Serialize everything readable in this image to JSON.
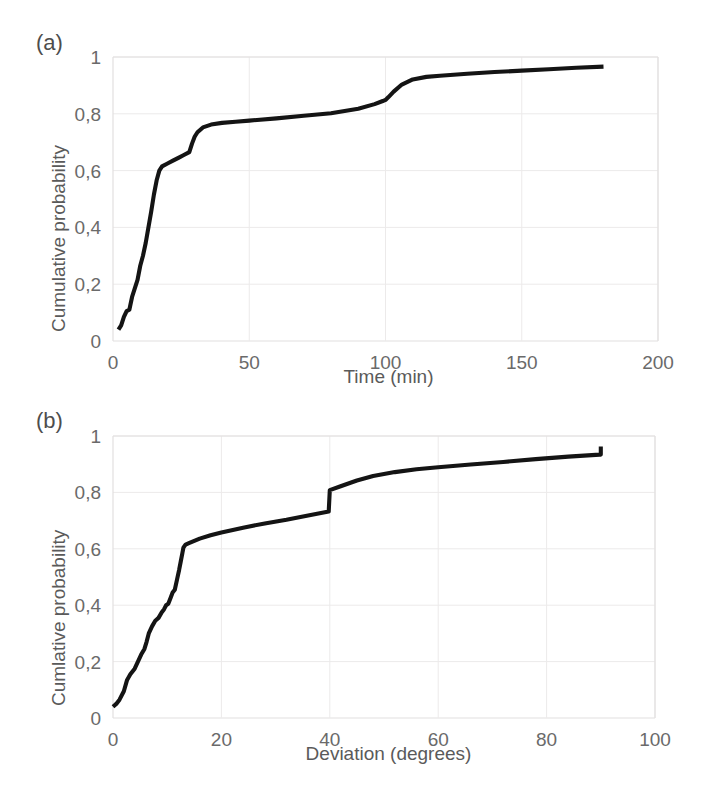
{
  "figure": {
    "background": "#ffffff",
    "curve_color": "#141414",
    "grid_color": "#eceaea",
    "text_color": "#5a5a5a"
  },
  "panels": [
    {
      "tag": "(a)",
      "ylabel": "Cumulative probability",
      "xlabel": "Time (min)",
      "xticks": [
        "0",
        "50",
        "100",
        "150",
        "200"
      ],
      "yticks": [
        "0",
        "0,2",
        "0,4",
        "0,6",
        "0,8",
        "1"
      ]
    },
    {
      "tag": "(b)",
      "ylabel": "Cumlative probability",
      "xlabel": "Deviation (degrees)",
      "xticks": [
        "0",
        "20",
        "40",
        "60",
        "80",
        "100"
      ],
      "yticks": [
        "0",
        "0,2",
        "0,4",
        "0,6",
        "0,8",
        "1"
      ]
    }
  ],
  "chart_data": [
    {
      "type": "line",
      "title": "(a)",
      "xlabel": "Time (min)",
      "ylabel": "Cumulative probability",
      "xlim": [
        0,
        200
      ],
      "ylim": [
        0,
        1
      ],
      "xticks": [
        0,
        50,
        100,
        150,
        200
      ],
      "yticks": [
        0,
        0.2,
        0.4,
        0.6,
        0.8,
        1
      ],
      "grid": true,
      "legend": "none",
      "decimal_separator": ",",
      "series": [
        {
          "name": "Cumulative distribution of time",
          "x": [
            2,
            3,
            4,
            5,
            6,
            7,
            8,
            9,
            10,
            11,
            12,
            13,
            14,
            15,
            16,
            17,
            18,
            20,
            22,
            24,
            26,
            28,
            29,
            30,
            31,
            33,
            36,
            40,
            45,
            50,
            60,
            70,
            80,
            90,
            96,
            99,
            100,
            101,
            103,
            106,
            110,
            115,
            120,
            130,
            140,
            150,
            160,
            170,
            180
          ],
          "y": [
            0.04,
            0.055,
            0.085,
            0.105,
            0.11,
            0.155,
            0.185,
            0.215,
            0.265,
            0.3,
            0.345,
            0.4,
            0.455,
            0.515,
            0.565,
            0.6,
            0.615,
            0.625,
            0.635,
            0.645,
            0.655,
            0.665,
            0.695,
            0.72,
            0.735,
            0.752,
            0.762,
            0.768,
            0.772,
            0.776,
            0.784,
            0.793,
            0.802,
            0.818,
            0.834,
            0.845,
            0.849,
            0.858,
            0.878,
            0.903,
            0.921,
            0.93,
            0.934,
            0.941,
            0.947,
            0.952,
            0.957,
            0.962,
            0.966
          ]
        }
      ]
    },
    {
      "type": "line",
      "title": "(b)",
      "xlabel": "Deviation (degrees)",
      "ylabel": "Cumlative probability",
      "xlim": [
        0,
        100
      ],
      "ylim": [
        0,
        1
      ],
      "xticks": [
        0,
        20,
        40,
        60,
        80,
        100
      ],
      "yticks": [
        0,
        0.2,
        0.4,
        0.6,
        0.8,
        1
      ],
      "grid": true,
      "legend": "none",
      "decimal_separator": ",",
      "annotations": [
        {
          "text": "vertical jump at x=40 from 0,73 to 0,81"
        },
        {
          "text": "vertical jump at x=90 from 0,93 to 0,96"
        }
      ],
      "series": [
        {
          "name": "Cumulative distribution of deviation",
          "x": [
            0,
            0.6,
            1.2,
            2,
            2.6,
            3.2,
            4,
            4.6,
            5.2,
            5.8,
            6.2,
            6.6,
            7.2,
            7.8,
            8.4,
            9,
            9.4,
            9.8,
            10.2,
            10.6,
            11,
            11.4,
            11.8,
            12.2,
            12.5,
            12.8,
            13,
            13.4,
            14,
            15,
            16,
            18,
            20,
            24,
            28,
            32,
            36,
            39.8,
            40,
            42,
            45,
            48,
            52,
            56,
            60,
            66,
            72,
            78,
            84,
            89.8,
            90,
            90
          ],
          "y": [
            0.04,
            0.05,
            0.065,
            0.095,
            0.135,
            0.155,
            0.175,
            0.2,
            0.225,
            0.245,
            0.27,
            0.3,
            0.325,
            0.345,
            0.355,
            0.375,
            0.385,
            0.4,
            0.405,
            0.425,
            0.445,
            0.455,
            0.49,
            0.525,
            0.555,
            0.585,
            0.605,
            0.615,
            0.62,
            0.628,
            0.636,
            0.648,
            0.658,
            0.675,
            0.69,
            0.703,
            0.718,
            0.732,
            0.808,
            0.822,
            0.842,
            0.858,
            0.872,
            0.882,
            0.889,
            0.899,
            0.908,
            0.918,
            0.927,
            0.934,
            0.934,
            0.963
          ]
        }
      ]
    }
  ]
}
